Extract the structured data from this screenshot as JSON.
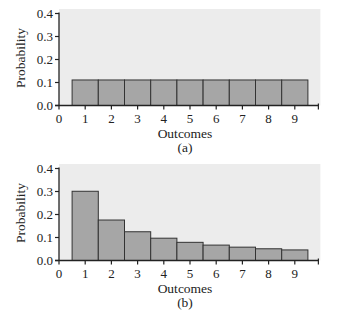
{
  "chart_data": [
    {
      "type": "bar",
      "panel_label": "(a)",
      "title": "",
      "xlabel": "Outcomes",
      "ylabel": "Probability",
      "categories": [
        "1",
        "2",
        "3",
        "4",
        "5",
        "6",
        "7",
        "8",
        "9"
      ],
      "values": [
        0.111,
        0.111,
        0.111,
        0.111,
        0.111,
        0.111,
        0.111,
        0.111,
        0.111
      ],
      "xticks": [
        "0",
        "1",
        "2",
        "3",
        "4",
        "5",
        "6",
        "7",
        "8",
        "9"
      ],
      "yticks": [
        "0.0",
        "0.1",
        "0.2",
        "0.3",
        "0.4"
      ],
      "xlim": [
        0,
        9.9
      ],
      "ylim": [
        0,
        0.4
      ],
      "grid": false,
      "legend": null
    },
    {
      "type": "bar",
      "panel_label": "(b)",
      "title": "",
      "xlabel": "Outcomes",
      "ylabel": "Probability",
      "categories": [
        "1",
        "2",
        "3",
        "4",
        "5",
        "6",
        "7",
        "8",
        "9"
      ],
      "values": [
        0.301,
        0.176,
        0.125,
        0.097,
        0.079,
        0.067,
        0.058,
        0.051,
        0.046
      ],
      "xticks": [
        "0",
        "1",
        "2",
        "3",
        "4",
        "5",
        "6",
        "7",
        "8",
        "9"
      ],
      "yticks": [
        "0.0",
        "0.1",
        "0.2",
        "0.3",
        "0.4"
      ],
      "xlim": [
        0,
        9.9
      ],
      "ylim": [
        0,
        0.4
      ],
      "grid": false,
      "legend": null
    }
  ],
  "colors": {
    "plot_background": "#ececec",
    "bar_fill": "#a6a6a6",
    "bar_edge": "#333333",
    "axis": "#222222"
  }
}
